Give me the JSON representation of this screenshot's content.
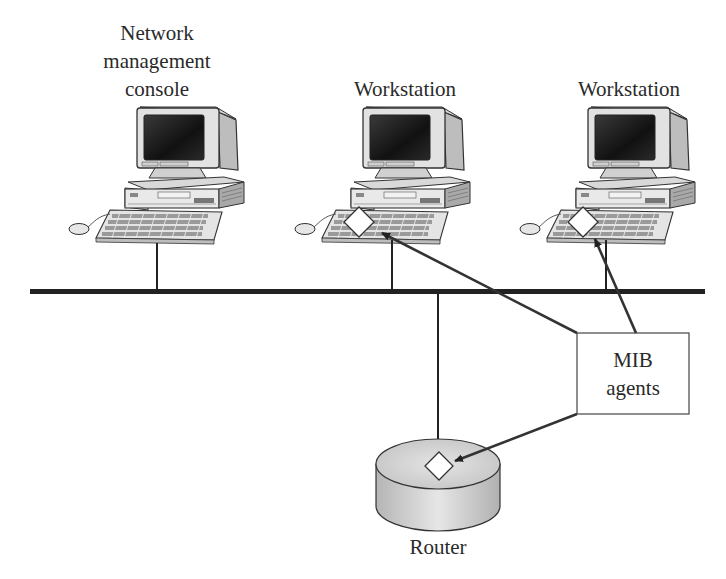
{
  "diagram": {
    "nodes": {
      "console": {
        "label_lines": [
          "Network",
          "management",
          "console"
        ],
        "type": "computer",
        "has_agent": false
      },
      "workstation1": {
        "label": "Workstation",
        "type": "computer",
        "has_agent": true
      },
      "workstation2": {
        "label": "Workstation",
        "type": "computer",
        "has_agent": true
      },
      "router": {
        "label": "Router",
        "type": "router",
        "has_agent": true
      }
    },
    "callout": {
      "label_lines": [
        "MIB",
        "agents"
      ],
      "points_to": [
        "workstation1",
        "workstation2",
        "router"
      ]
    },
    "network": {
      "type": "bus",
      "attached": [
        "console",
        "workstation1",
        "workstation2",
        "router"
      ]
    },
    "colors": {
      "line": "#222222",
      "router_fill": "#c8c8c8",
      "agent_marker": "#ffffff",
      "screen": "#1a1a1a"
    }
  }
}
